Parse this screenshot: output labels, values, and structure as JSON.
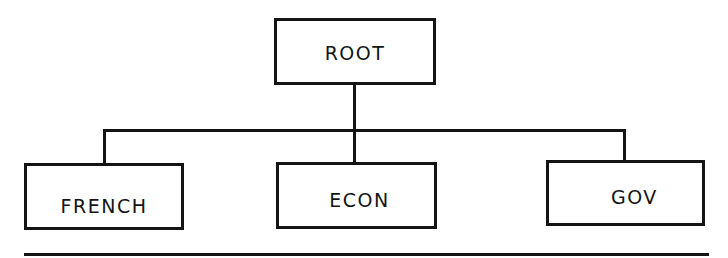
{
  "diagram": {
    "type": "tree",
    "colors": {
      "stroke": "#141414",
      "background": "#ffffff"
    },
    "root": {
      "id": "root",
      "label": "ROOT"
    },
    "children": [
      {
        "id": "french",
        "label": "FRENCH"
      },
      {
        "id": "econ",
        "label": "ECON"
      },
      {
        "id": "gov",
        "label": "GOV"
      }
    ],
    "edges": [
      {
        "from": "ROOT",
        "to": "FRENCH"
      },
      {
        "from": "ROOT",
        "to": "ECON"
      },
      {
        "from": "ROOT",
        "to": "GOV"
      }
    ]
  }
}
